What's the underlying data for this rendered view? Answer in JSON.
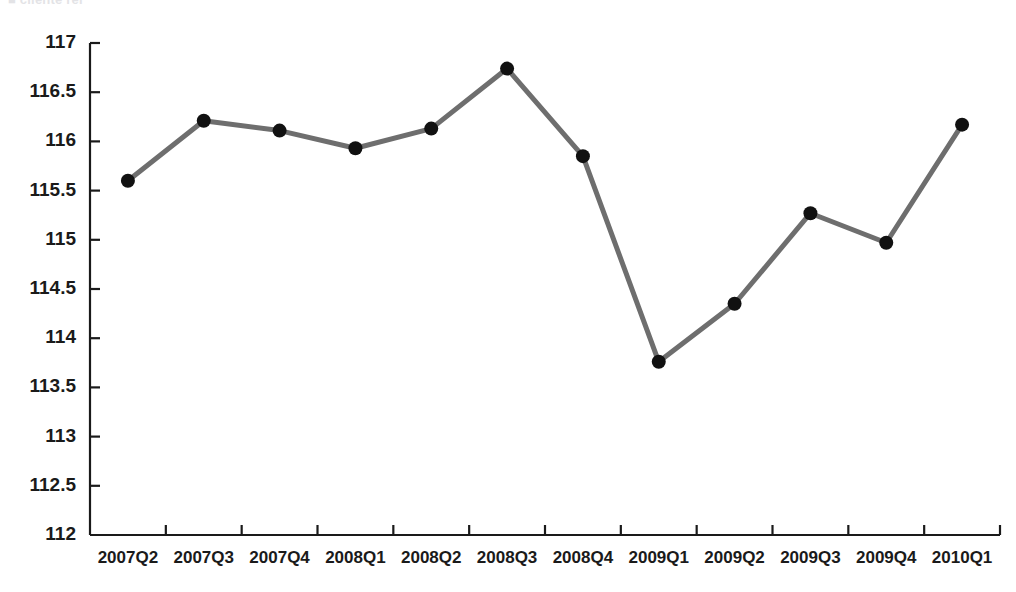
{
  "chart_data": {
    "type": "line",
    "title": "",
    "xlabel": "",
    "ylabel": "",
    "categories": [
      "2007Q2",
      "2007Q3",
      "2007Q4",
      "2008Q1",
      "2008Q2",
      "2008Q3",
      "2008Q4",
      "2009Q1",
      "2009Q2",
      "2009Q3",
      "2009Q4",
      "2010Q1"
    ],
    "values": [
      115.6,
      116.21,
      116.11,
      115.93,
      116.13,
      116.74,
      115.85,
      113.76,
      114.35,
      115.27,
      114.97,
      116.17
    ],
    "ylim": [
      112,
      117
    ],
    "ytick_labels": [
      "117",
      "116.5",
      "116",
      "115.5",
      "115",
      "114.5",
      "114",
      "113.5",
      "113",
      "112.5",
      "112"
    ],
    "ytick_values": [
      117,
      116.5,
      116,
      115.5,
      115,
      114.5,
      114,
      113.5,
      113,
      112.5,
      112
    ],
    "grid": false,
    "legend": "none",
    "line_color": "#6e6e6e",
    "marker_color": "#111111",
    "axis_color": "#1a1a1a",
    "line_width": 5,
    "marker_radius": 7
  },
  "clipped_header": "■ cliente rei"
}
